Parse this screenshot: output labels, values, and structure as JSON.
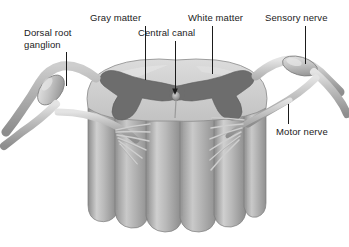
{
  "figure": {
    "background_color": "#ffffff",
    "width": 349,
    "height": 247
  },
  "labels": {
    "dorsal_root_ganglion": "Dorsal root\nganglion",
    "gray_matter": "Gray matter",
    "central_canal": "Central canal",
    "white_matter": "White matter",
    "sensory_nerve": "Sensory nerve",
    "motor_nerve": "Motor nerve"
  },
  "colors": {
    "leader_line": "#1b1b1b",
    "label_text": "#1b1b1b",
    "gray_matter": "#6d6d6d",
    "gray_matter_dark": "#5d5d5d",
    "white_matter": "#c9c9c9",
    "white_matter_light": "#dcdcdc",
    "cord_column": "#b4b4b4",
    "cord_column_shadow": "#8f8f8f",
    "nerve": "#b9b9b9",
    "nerve_shadow": "#8a8a8a",
    "nerve_highlight": "#e2e2e2",
    "ganglion": "#c4c4c4",
    "outline": "#6f6f6f",
    "central_canal": "#8a8a8a"
  },
  "structures": {
    "spinal_cord": "spinal-cord-body",
    "gray_matter_region": "butterfly-shaped gray matter",
    "white_matter_region": "peripheral white matter",
    "central_canal_point": "central canal opening",
    "left_ganglion": "dorsal root ganglion (left)",
    "right_ganglion": "dorsal root ganglion (right)",
    "left_rootlets": "nerve rootlets (left)",
    "right_rootlets": "nerve rootlets (right)",
    "sensory_branch": "sensory nerve branch",
    "motor_branch": "motor nerve branch"
  }
}
